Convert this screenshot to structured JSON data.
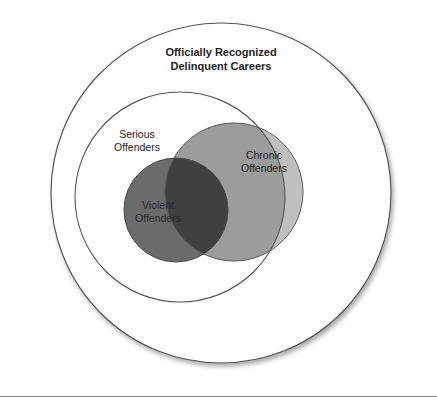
{
  "diagram": {
    "type": "nested-venn",
    "sets": [
      {
        "id": "official",
        "label_line1": "Officially Recognized",
        "label_line2": "Delinquent Careers",
        "fill": "#ffffff",
        "stroke": "#555555"
      },
      {
        "id": "serious",
        "label_line1": "Serious",
        "label_line2": "Offenders",
        "fill": "#ffffff",
        "stroke": "#555555"
      },
      {
        "id": "chronic",
        "label_line1": "Chronic",
        "label_line2": "Offenders",
        "fill_inside_serious": "#9c9c9c",
        "fill_outside_serious": "#bfbfbf",
        "stroke": "#555555"
      },
      {
        "id": "violent",
        "label_line1": "Violent",
        "label_line2": "Offenders",
        "fill": "#6b6b6b",
        "fill_overlap_chronic": "#404040",
        "stroke": "#444444"
      }
    ]
  }
}
